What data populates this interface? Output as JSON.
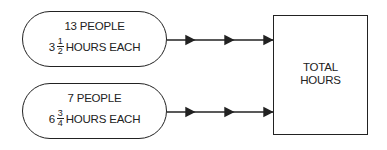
{
  "diagram": {
    "inputs": [
      {
        "line1": "13 PEOPLE",
        "whole": "3",
        "num": "1",
        "den": "2",
        "suffix": "HOURS EACH"
      },
      {
        "line1": "7 PEOPLE",
        "whole": "6",
        "num": "3",
        "den": "4",
        "suffix": "HOURS EACH"
      }
    ],
    "output": {
      "line1": "TOTAL",
      "line2": "HOURS"
    },
    "colors": {
      "stroke": "#222222",
      "background": "#ffffff"
    }
  }
}
